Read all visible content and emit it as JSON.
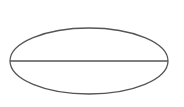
{
  "diagram": {
    "background": "#ffffff",
    "stroke_color": "#555555",
    "stroke_width": 1.3,
    "ellipse": {
      "cx": 89,
      "cy": 61,
      "rx": 79,
      "ry": 33
    },
    "diameter_line": {
      "x1": 10,
      "y1": 61,
      "x2": 168,
      "y2": 61
    }
  }
}
